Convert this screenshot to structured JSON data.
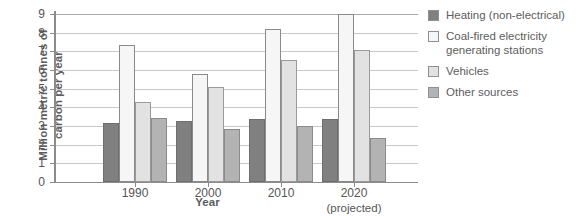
{
  "chart_data": {
    "type": "bar",
    "title": "",
    "xlabel": "Year",
    "ylabel": "Million metric tonnes of\ncarbon per year",
    "categories": [
      "1990",
      "2000",
      "2010",
      "2020"
    ],
    "category_sublabels": [
      "",
      "",
      "",
      "(projected)"
    ],
    "ylim": [
      0,
      9
    ],
    "yticks": [
      0,
      1,
      2,
      3,
      4,
      5,
      6,
      7,
      8,
      9
    ],
    "ytick_labels": [
      "0",
      "1",
      "2",
      "3",
      "4",
      "5",
      "6",
      "7",
      "8",
      "9"
    ],
    "grid": true,
    "legend_position": "right",
    "series": [
      {
        "name": "Heating (non-electrical)",
        "color": "#808080",
        "values": [
          3.15,
          3.25,
          3.35,
          3.4
        ]
      },
      {
        "name": "Coal-fired electricity\ngenerating stations",
        "color": "#f6f6f6",
        "values": [
          7.35,
          5.8,
          8.2,
          9.0
        ]
      },
      {
        "name": "Vehicles",
        "color": "#e2e2e2",
        "values": [
          4.3,
          5.1,
          6.55,
          7.05
        ]
      },
      {
        "name": "Other sources",
        "color": "#b3b3b3",
        "values": [
          3.45,
          2.85,
          3.0,
          2.35
        ]
      }
    ]
  }
}
